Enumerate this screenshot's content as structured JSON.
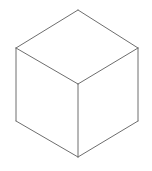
{
  "figure": {
    "canvas": {
      "width": 152,
      "height": 171,
      "background_color": "#ffffff"
    },
    "stroke": {
      "color": "#6e6e6e",
      "width": 1,
      "style": "solid"
    },
    "fill_color": "#ffffff",
    "shape_type": "cube",
    "projection": "isometric",
    "vertices": {
      "top": {
        "x": 78,
        "y": 10
      },
      "upper_left": {
        "x": 16,
        "y": 48
      },
      "upper_right": {
        "x": 138,
        "y": 48
      },
      "center": {
        "x": 78,
        "y": 84
      },
      "lower_left": {
        "x": 16,
        "y": 121
      },
      "lower_right": {
        "x": 138,
        "y": 121
      },
      "bottom": {
        "x": 78,
        "y": 157
      }
    },
    "faces": [
      {
        "name": "top-face",
        "label": "Top Face",
        "points": "78,10 138,48 78,84 16,48"
      },
      {
        "name": "left-face",
        "label": "Left Face",
        "points": "16,48 78,84 78,157 16,121"
      },
      {
        "name": "right-face",
        "label": "Right Face",
        "points": "78,84 138,48 138,121 78,157"
      }
    ],
    "edges": [
      {
        "name": "edge-top-to-upper-left",
        "label": "Top to Upper Left",
        "d": "M 78,10 L 16,48"
      },
      {
        "name": "edge-top-to-upper-right",
        "label": "Top to Upper Right",
        "d": "M 78,10 L 138,48"
      },
      {
        "name": "edge-upper-left-to-center",
        "label": "Upper Left to Center",
        "d": "M 16,48 L 78,84"
      },
      {
        "name": "edge-upper-right-to-center",
        "label": "Upper Right to Center",
        "d": "M 138,48 L 78,84"
      },
      {
        "name": "edge-upper-left-vertical",
        "label": "Left Vertical Edge",
        "d": "M 16,48 L 16,121"
      },
      {
        "name": "edge-upper-right-vertical",
        "label": "Right Vertical Edge",
        "d": "M 138,48 L 138,121"
      },
      {
        "name": "edge-center-vertical",
        "label": "Center Vertical Edge",
        "d": "M 78,84 L 78,157"
      },
      {
        "name": "edge-lower-left-to-bottom",
        "label": "Lower Left to Bottom",
        "d": "M 16,121 L 78,157"
      },
      {
        "name": "edge-lower-right-to-bottom",
        "label": "Lower Right to Bottom",
        "d": "M 138,121 L 78,157"
      }
    ]
  }
}
